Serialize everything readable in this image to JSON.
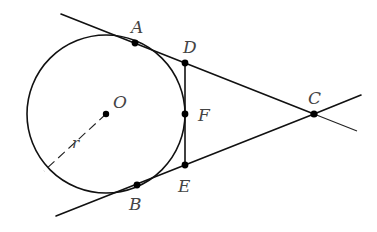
{
  "diagram": {
    "title": "",
    "circle": {
      "center_label": "O",
      "cx": 106,
      "cy": 114,
      "r": 79,
      "radius_label": "r"
    },
    "points": {
      "A": {
        "label": "A",
        "x": 135,
        "y": 43
      },
      "B": {
        "label": "B",
        "x": 137,
        "y": 185
      },
      "C": {
        "label": "C",
        "x": 314,
        "y": 114
      },
      "D": {
        "label": "D",
        "x": 185,
        "y": 63
      },
      "E": {
        "label": "E",
        "x": 185,
        "y": 165
      },
      "F": {
        "label": "F",
        "x": 185,
        "y": 114
      },
      "O": {
        "label": "O",
        "x": 106,
        "y": 114
      }
    },
    "segments": [
      {
        "name": "tangent-line-AC",
        "from": [
          61,
          14
        ],
        "to": [
          357,
          130
        ]
      },
      {
        "name": "tangent-line-BC",
        "from": [
          56,
          216
        ],
        "to": [
          361,
          95
        ]
      },
      {
        "name": "tangent-segment-DE",
        "from": "D",
        "to": "E"
      },
      {
        "name": "radius-r",
        "from": "O",
        "to": [
          44,
          171
        ],
        "style": "dashed"
      }
    ],
    "colors": {
      "stroke": "#111111",
      "label": "#444444",
      "background": "#ffffff"
    }
  }
}
